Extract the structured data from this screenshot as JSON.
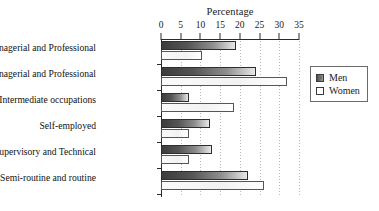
{
  "chart_data": {
    "type": "bar",
    "orientation": "horizontal",
    "title": "",
    "xlabel": "Percentage",
    "ylabel": "",
    "xlim": [
      0,
      35
    ],
    "xticks": [
      0,
      5,
      10,
      15,
      20,
      25,
      30,
      35
    ],
    "grid": true,
    "grid_axis": "x",
    "legend_position": "right",
    "axis_position": "top",
    "categories": [
      "Higher Managerial and Professional",
      "Lower Managerial and Professional",
      "Intermediate occupations",
      "Self-employed",
      "Lower Supervisory and Technical",
      "Semi-routine and routine"
    ],
    "series": [
      {
        "name": "Men",
        "values": [
          19,
          24,
          7,
          12.5,
          13,
          22
        ]
      },
      {
        "name": "Women",
        "values": [
          10.5,
          32,
          18.5,
          7,
          7,
          26
        ]
      }
    ]
  },
  "legend": {
    "entries": [
      {
        "label": "Men",
        "swatch": "men-swatch"
      },
      {
        "label": "Women",
        "swatch": "women-swatch"
      }
    ]
  },
  "colors": {
    "men_fill_dark": "#3c3c3c",
    "men_fill_light": "#e8e8e8",
    "women_fill": "#fbfbfb",
    "bar_border": "#4a4a4a",
    "axis": "#2b2b2b",
    "grid": "#b9b9b9",
    "background": "#ffffff",
    "text": "#111111"
  }
}
